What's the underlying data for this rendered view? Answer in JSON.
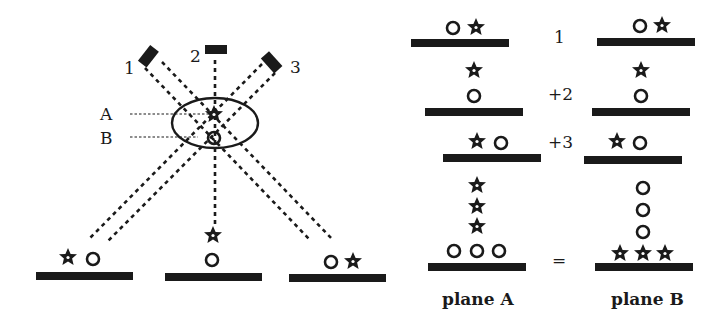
{
  "left_panel": {
    "detectors": [
      {
        "label": "1"
      },
      {
        "label": "2"
      },
      {
        "label": "3"
      }
    ],
    "planes": [
      {
        "label": "A",
        "object": "star"
      },
      {
        "label": "B",
        "object": "circle"
      }
    ],
    "projections": [
      {
        "view": "1",
        "symbols": [
          "star",
          "circle"
        ]
      },
      {
        "view": "2",
        "symbols": [
          "star-above",
          "circle"
        ]
      },
      {
        "view": "3",
        "symbols": [
          "circle",
          "star"
        ]
      }
    ]
  },
  "right_panel": {
    "rows": [
      {
        "operator": "1",
        "plane_a": [
          "circle",
          "star"
        ],
        "plane_b": [
          "circle",
          "star"
        ]
      },
      {
        "operator": "+2",
        "plane_a": [
          "star-above",
          "circle"
        ],
        "plane_b": [
          "star-above",
          "circle"
        ]
      },
      {
        "operator": "+3",
        "plane_a": [
          "star",
          "circle"
        ],
        "plane_b": [
          "star",
          "circle"
        ]
      },
      {
        "operator": "=",
        "plane_a": [
          "3 stars stacked",
          "3 circles in row"
        ],
        "plane_b": [
          "3 circles stacked",
          "3 stars in row"
        ]
      }
    ],
    "column_labels": {
      "plane_a": "plane A",
      "plane_b": "plane B"
    }
  },
  "colors": {
    "ink": "#1a1a1a",
    "background": "#ffffff"
  }
}
